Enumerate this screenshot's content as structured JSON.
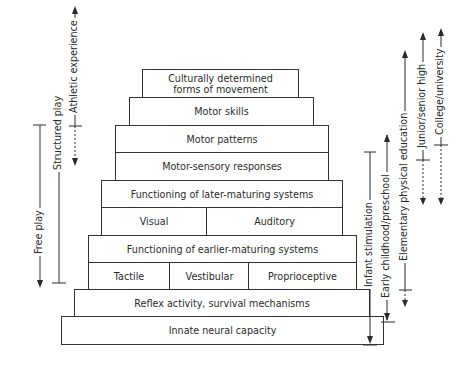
{
  "diagram": {
    "type": "pyramid",
    "levels": [
      {
        "label": "Culturally determined forms of movement",
        "line1": "Culturally determined",
        "line2": "forms of movement"
      },
      {
        "label": "Motor skills"
      },
      {
        "label": "Motor patterns"
      },
      {
        "label": "Motor-sensory responses"
      },
      {
        "label": "Functioning of later-maturing systems"
      },
      {
        "cells": [
          "Visual",
          "Auditory"
        ]
      },
      {
        "label": "Functioning of earlier-maturing systems"
      },
      {
        "cells": [
          "Tactile",
          "Vestibular",
          "Proprioceptive"
        ]
      },
      {
        "label": "Reflex activity, survival mechanisms"
      },
      {
        "label": "Innate neural capacity"
      }
    ],
    "left_ranges": [
      {
        "label": "Athletic experience",
        "style": "solid-up-dashed-down"
      },
      {
        "label": "Free play",
        "style": "solid-down"
      },
      {
        "label": "Structured play",
        "style": "solid"
      }
    ],
    "right_ranges": [
      {
        "label": "Infant stimulation",
        "style": "solid-down"
      },
      {
        "label": "Early childhood/preschool",
        "style": "solid-both"
      },
      {
        "label": "Elementary physical education",
        "style": "solid-up-dashed-down"
      },
      {
        "label": "Junior/senior high",
        "style": "solid-up-dashed-down"
      },
      {
        "label": "College/university",
        "style": "solid-up-dashed-down"
      }
    ]
  }
}
